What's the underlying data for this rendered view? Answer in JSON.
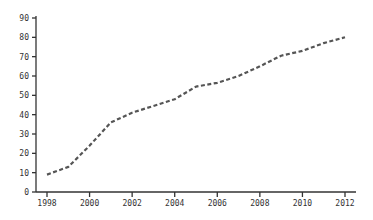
{
  "chart_data": {
    "type": "line",
    "title": "",
    "xlabel": "",
    "ylabel": "",
    "x": [
      1998,
      1999,
      2000,
      2001,
      2002,
      2003,
      2004,
      2005,
      2006,
      2007,
      2008,
      2009,
      2010,
      2011,
      2012
    ],
    "series": [
      {
        "name": "series",
        "values": [
          9,
          13,
          24,
          36,
          41,
          44.5,
          48,
          54.5,
          56.5,
          60,
          65,
          70.5,
          73,
          77,
          80
        ],
        "color": "#555555",
        "style": "dashed"
      }
    ],
    "xticks": [
      "1998",
      "2000",
      "2002",
      "2004",
      "2006",
      "2008",
      "2010",
      "2012"
    ],
    "yticks": [
      "0",
      "10",
      "20",
      "30",
      "40",
      "50",
      "60",
      "70",
      "80",
      "90"
    ],
    "xlim": [
      1998,
      2012
    ],
    "ylim": [
      0,
      90
    ],
    "grid": false,
    "legend": null
  },
  "colors": {
    "axis": "#333333",
    "line": "#555555",
    "background": "#ffffff"
  }
}
